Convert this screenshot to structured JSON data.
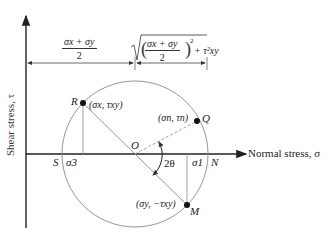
{
  "diagram": {
    "axes": {
      "x_label": "Normal stress, σ",
      "y_label": "Shear stress, τ"
    },
    "dimensions": {
      "left_numerator": "σx + σy",
      "left_denominator": "2",
      "right_radical_numerator": "σx + σy",
      "right_radical_denominator": "2",
      "right_radical_suffix": "+ τ²xy"
    },
    "points": {
      "R": {
        "label": "R",
        "coords": "(σx, τxy)"
      },
      "Q": {
        "label": "Q",
        "coords": "(σn, τn)"
      },
      "M": {
        "label": "M",
        "coords": "(σy, −τxy)"
      },
      "O": {
        "label": "O"
      },
      "S": {
        "label": "S"
      },
      "N": {
        "label": "N"
      }
    },
    "principal": {
      "sigma3": "σ3",
      "sigma1": "σ1"
    },
    "angle_label": "2θ",
    "colors": {
      "axis": "#222222",
      "circle": "#888888",
      "lines": "#999999",
      "points": "#111111"
    }
  }
}
